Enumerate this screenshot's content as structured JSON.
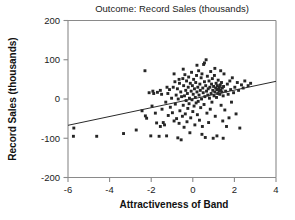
{
  "chart_data": {
    "type": "scatter",
    "title": "Outcome: Record Sales (thousands)",
    "xlabel": "Attractiveness of Band",
    "ylabel": "Record Sales (thousands)",
    "xlim": [
      -6,
      4
    ],
    "ylim": [
      -200,
      200
    ],
    "xticks": [
      -6,
      -4,
      -2,
      0,
      2,
      4
    ],
    "yticks": [
      -200,
      -100,
      0,
      100,
      200
    ],
    "xticklabels": [
      "-6",
      "-4",
      "-2",
      "0",
      "2",
      "4"
    ],
    "yticklabels": [
      "-200",
      "-100",
      "0",
      "100",
      "200"
    ],
    "grid": false,
    "legend": null,
    "marker": "square",
    "marker_color": "#262626",
    "trendline": {
      "type": "linear",
      "color": "#2a2a2a",
      "x_start": -6,
      "y_start": -67,
      "x_end": 4,
      "y_end": 45,
      "slope": 11.2,
      "intercept": 0.2
    },
    "points": [
      [
        -5.72,
        -74
      ],
      [
        -5.74,
        -95
      ],
      [
        -4.62,
        -95
      ],
      [
        -3.33,
        -88
      ],
      [
        -2.72,
        -79
      ],
      [
        -2.3,
        72
      ],
      [
        -2.28,
        -43
      ],
      [
        -2.22,
        -49
      ],
      [
        -2.1,
        16
      ],
      [
        -2.02,
        -94
      ],
      [
        -1.92,
        20
      ],
      [
        -1.88,
        14
      ],
      [
        -1.8,
        -36
      ],
      [
        -1.74,
        -61
      ],
      [
        -1.7,
        17
      ],
      [
        -1.62,
        -95
      ],
      [
        -1.56,
        22
      ],
      [
        -1.5,
        12
      ],
      [
        -1.48,
        -26
      ],
      [
        -1.42,
        -60
      ],
      [
        -1.36,
        -66
      ],
      [
        -1.3,
        -8
      ],
      [
        -1.26,
        -94
      ],
      [
        -1.2,
        14
      ],
      [
        -1.18,
        -42
      ],
      [
        -1.12,
        24
      ],
      [
        -1.08,
        -21
      ],
      [
        -1.02,
        2
      ],
      [
        -0.98,
        -35
      ],
      [
        -0.94,
        30
      ],
      [
        -0.9,
        -56
      ],
      [
        -0.86,
        44
      ],
      [
        -0.84,
        -13
      ],
      [
        -0.8,
        10
      ],
      [
        -0.78,
        -50
      ],
      [
        -0.74,
        26
      ],
      [
        -0.72,
        -99
      ],
      [
        -0.7,
        0
      ],
      [
        -0.66,
        -62
      ],
      [
        -0.64,
        40
      ],
      [
        -0.62,
        -30
      ],
      [
        -0.58,
        18
      ],
      [
        -0.56,
        -104
      ],
      [
        -0.54,
        6
      ],
      [
        -0.5,
        -44
      ],
      [
        -0.48,
        52
      ],
      [
        -0.46,
        -16
      ],
      [
        -0.44,
        34
      ],
      [
        -0.42,
        -72
      ],
      [
        -0.4,
        8
      ],
      [
        -0.38,
        62
      ],
      [
        -0.36,
        -38
      ],
      [
        -0.34,
        22
      ],
      [
        -0.32,
        -4
      ],
      [
        -0.3,
        46
      ],
      [
        -0.28,
        -58
      ],
      [
        -0.26,
        14
      ],
      [
        -0.24,
        -24
      ],
      [
        -0.22,
        30
      ],
      [
        -0.2,
        56
      ],
      [
        -0.18,
        -12
      ],
      [
        -0.16,
        2
      ],
      [
        -0.14,
        -86
      ],
      [
        -0.12,
        40
      ],
      [
        -0.1,
        -48
      ],
      [
        -0.08,
        20
      ],
      [
        -0.06,
        68
      ],
      [
        -0.04,
        -2
      ],
      [
        -0.02,
        34
      ],
      [
        0.0,
        -32
      ],
      [
        0.02,
        12
      ],
      [
        0.04,
        50
      ],
      [
        0.06,
        -18
      ],
      [
        0.08,
        26
      ],
      [
        0.1,
        -66
      ],
      [
        0.12,
        4
      ],
      [
        0.14,
        42
      ],
      [
        0.16,
        -10
      ],
      [
        0.18,
        60
      ],
      [
        0.2,
        18
      ],
      [
        0.22,
        -40
      ],
      [
        0.24,
        30
      ],
      [
        0.26,
        -6
      ],
      [
        0.28,
        72
      ],
      [
        0.3,
        10
      ],
      [
        0.32,
        -54
      ],
      [
        0.34,
        38
      ],
      [
        0.36,
        22
      ],
      [
        0.38,
        -22
      ],
      [
        0.4,
        54
      ],
      [
        0.42,
        0
      ],
      [
        0.44,
        64
      ],
      [
        0.46,
        -70
      ],
      [
        0.48,
        28
      ],
      [
        0.5,
        16
      ],
      [
        0.52,
        88
      ],
      [
        0.54,
        -14
      ],
      [
        0.56,
        44
      ],
      [
        0.58,
        6
      ],
      [
        0.6,
        -98
      ],
      [
        0.62,
        34
      ],
      [
        0.64,
        100
      ],
      [
        0.66,
        20
      ],
      [
        0.68,
        -36
      ],
      [
        0.7,
        58
      ],
      [
        0.72,
        10
      ],
      [
        0.74,
        26
      ],
      [
        0.76,
        -60
      ],
      [
        0.78,
        46
      ],
      [
        0.8,
        2
      ],
      [
        0.82,
        30
      ],
      [
        0.84,
        -26
      ],
      [
        0.86,
        70
      ],
      [
        0.88,
        14
      ],
      [
        0.9,
        38
      ],
      [
        0.92,
        -8
      ],
      [
        0.94,
        52
      ],
      [
        0.96,
        22
      ],
      [
        0.98,
        -100
      ],
      [
        1.0,
        32
      ],
      [
        1.02,
        8
      ],
      [
        1.04,
        60
      ],
      [
        1.06,
        18
      ],
      [
        1.08,
        -44
      ],
      [
        1.1,
        28
      ],
      [
        1.12,
        40
      ],
      [
        1.14,
        4
      ],
      [
        1.16,
        24
      ],
      [
        1.18,
        34
      ],
      [
        1.2,
        14
      ],
      [
        1.22,
        48
      ],
      [
        1.24,
        26
      ],
      [
        1.26,
        20
      ],
      [
        1.28,
        30
      ],
      [
        1.3,
        12
      ],
      [
        1.32,
        36
      ],
      [
        1.34,
        22
      ],
      [
        1.36,
        -16
      ],
      [
        1.38,
        42
      ],
      [
        1.4,
        18
      ],
      [
        1.42,
        28
      ],
      [
        1.44,
        -56
      ],
      [
        1.46,
        8
      ],
      [
        1.48,
        32
      ],
      [
        1.5,
        64
      ],
      [
        1.54,
        -28
      ],
      [
        1.58,
        20
      ],
      [
        1.62,
        -70
      ],
      [
        1.66,
        38
      ],
      [
        1.7,
        12
      ],
      [
        1.74,
        -48
      ],
      [
        1.78,
        46
      ],
      [
        1.82,
        24
      ],
      [
        1.86,
        -8
      ],
      [
        1.9,
        54
      ],
      [
        1.96,
        16
      ],
      [
        2.02,
        30
      ],
      [
        2.08,
        -38
      ],
      [
        2.14,
        42
      ],
      [
        2.2,
        22
      ],
      [
        2.26,
        -74
      ],
      [
        2.34,
        36
      ],
      [
        2.42,
        28
      ],
      [
        2.5,
        46
      ],
      [
        2.66,
        34
      ],
      [
        2.78,
        40
      ],
      [
        0.2,
        86
      ],
      [
        0.56,
        92
      ],
      [
        -0.46,
        76
      ],
      [
        -0.9,
        64
      ],
      [
        1.06,
        78
      ],
      [
        1.34,
        72
      ],
      [
        -1.56,
        -70
      ],
      [
        -1.24,
        30
      ],
      [
        -0.66,
        50
      ],
      [
        0.44,
        -90
      ],
      [
        1.16,
        -94
      ],
      [
        1.46,
        -100
      ],
      [
        -2.44,
        -30
      ],
      [
        -1.96,
        -18
      ]
    ]
  }
}
